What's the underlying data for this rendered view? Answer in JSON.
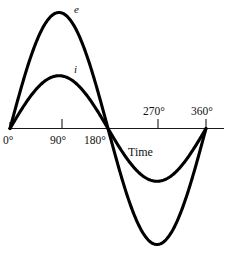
{
  "chart_data": {
    "type": "line",
    "title": "",
    "subtitle": "",
    "xlabel": "Time",
    "ylabel": "",
    "grid": false,
    "legend_position": "inline-curve-labels",
    "x_unit": "degrees",
    "xlim": [
      0,
      390
    ],
    "ylim": [
      -1.05,
      1.05
    ],
    "x_tick_labels": [
      "0°",
      "90°",
      "180°",
      "270°",
      "360°"
    ],
    "x_tick_values": [
      0,
      90,
      180,
      270,
      360
    ],
    "x_tick_label_side": [
      "below",
      "below",
      "below",
      "above",
      "above"
    ],
    "series": [
      {
        "name": "e",
        "label": "e",
        "label_x_deg": 118,
        "label_y_value": 1.0,
        "amplitude": 1.0,
        "phase_deg": 0,
        "color": "#000000",
        "x": [
          0,
          30,
          60,
          90,
          120,
          150,
          180,
          210,
          240,
          270,
          300,
          330,
          360
        ],
        "values": [
          0,
          0.5,
          0.866,
          1.0,
          0.866,
          0.5,
          0,
          -0.5,
          -0.866,
          -1.0,
          -0.866,
          -0.5,
          0
        ]
      },
      {
        "name": "i",
        "label": "i",
        "label_x_deg": 118,
        "label_y_value": 0.47,
        "amplitude": 0.455,
        "phase_deg": 0,
        "color": "#000000",
        "x": [
          0,
          30,
          60,
          90,
          120,
          150,
          180,
          210,
          240,
          270,
          300,
          330,
          360
        ],
        "values": [
          0,
          0.228,
          0.394,
          0.455,
          0.394,
          0.228,
          0,
          -0.228,
          -0.394,
          -0.455,
          -0.394,
          -0.228,
          0
        ]
      }
    ],
    "annotations": [
      {
        "text": "e",
        "meaning": "voltage-waveform-label"
      },
      {
        "text": "i",
        "meaning": "current-waveform-label"
      }
    ]
  },
  "axis": {
    "time_label": "Time",
    "tick_0": "0°",
    "tick_90": "90°",
    "tick_180": "180°",
    "tick_270": "270°",
    "tick_360": "360°"
  },
  "curves": {
    "voltage_label": "e",
    "current_label": "i"
  },
  "colors": {
    "curve": "#000000",
    "axis": "#1a1a1a",
    "background": "#ffffff"
  }
}
